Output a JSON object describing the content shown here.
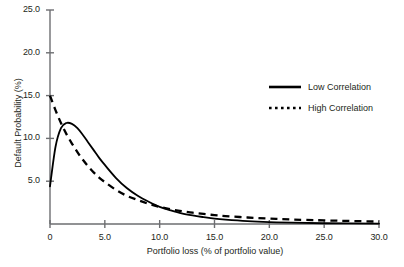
{
  "chart_data": {
    "type": "line",
    "title": "",
    "xlabel": "Portfolio loss (% of portfolio value)",
    "ylabel": "Default Probability (%)",
    "xlim": [
      0,
      30
    ],
    "ylim": [
      0,
      25
    ],
    "xticks": [
      "0",
      "5.0",
      "10.0",
      "15.0",
      "20.0",
      "25.0",
      "30.0"
    ],
    "xtick_values": [
      0,
      5,
      10,
      15,
      20,
      25,
      30
    ],
    "yticks": [
      "5.0",
      "10.0",
      "15.0",
      "20.0",
      "25.0"
    ],
    "ytick_values": [
      5,
      10,
      15,
      20,
      25
    ],
    "grid": false,
    "legend_position": "right",
    "x": [
      0,
      0.5,
      1,
      1.5,
      2,
      2.5,
      3,
      3.5,
      4,
      4.5,
      5,
      6,
      7,
      8,
      9,
      10,
      11,
      12,
      13,
      14,
      15,
      16,
      18,
      20,
      22,
      25,
      30
    ],
    "series": [
      {
        "name": "Low Correlation",
        "style": "solid",
        "color": "#000000",
        "values": [
          4.4,
          9.0,
          11.2,
          11.8,
          11.7,
          11.2,
          10.4,
          9.5,
          8.6,
          7.7,
          6.9,
          5.4,
          4.2,
          3.3,
          2.6,
          2.0,
          1.6,
          1.25,
          1.0,
          0.8,
          0.62,
          0.5,
          0.33,
          0.22,
          0.15,
          0.09,
          0.04
        ]
      },
      {
        "name": "High Correlation",
        "style": "dashed",
        "color": "#000000",
        "values": [
          15.0,
          13.3,
          11.8,
          10.5,
          9.4,
          8.4,
          7.5,
          6.7,
          6.0,
          5.4,
          4.9,
          4.0,
          3.3,
          2.8,
          2.35,
          2.0,
          1.72,
          1.5,
          1.32,
          1.17,
          1.04,
          0.93,
          0.76,
          0.63,
          0.53,
          0.42,
          0.28
        ]
      }
    ],
    "legend": [
      {
        "label": "Low Correlation",
        "style": "solid"
      },
      {
        "label": "High Correlation",
        "style": "dotted"
      }
    ]
  },
  "axis": {
    "y_ticks": [
      {
        "label": "25.0"
      },
      {
        "label": "20.0"
      },
      {
        "label": "15.0"
      },
      {
        "label": "10.0"
      },
      {
        "label": "5.0"
      }
    ],
    "x_ticks": [
      {
        "label": "0"
      },
      {
        "label": "5.0"
      },
      {
        "label": "10.0"
      },
      {
        "label": "15.0"
      },
      {
        "label": "20.0"
      },
      {
        "label": "25.0"
      },
      {
        "label": "30.0"
      }
    ]
  },
  "colors": {
    "axis": "#6d6e71",
    "curve": "#000000",
    "text": "#231f20",
    "background": "#ffffff"
  }
}
